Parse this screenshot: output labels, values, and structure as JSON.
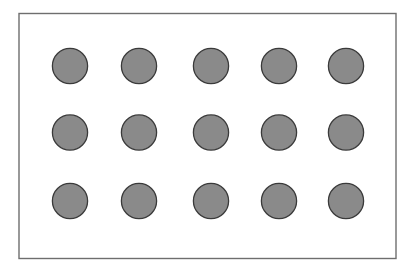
{
  "figure": {
    "canvas": {
      "width": 415,
      "height": 275,
      "background_color": "#FFFFFF"
    },
    "frame": {
      "name": "outer-rectangle",
      "x": 19,
      "y": 13.5,
      "width": 377,
      "height": 245,
      "fill_color": "#FFFFFF",
      "stroke_color": "#6E6E6E",
      "stroke_width": 1.4
    },
    "grid": {
      "rows": 3,
      "columns": 5,
      "count": 15,
      "shape": "circle",
      "radius": 17.6,
      "diameter": 35.2,
      "fill_color": "#8A8A8A",
      "stroke_color": "#3A3A3A",
      "stroke_width": 1.3,
      "column_centers_x": [
        70,
        139,
        211,
        279,
        346
      ],
      "row_centers_y": [
        66,
        132.5,
        201
      ],
      "column_spacing": 69,
      "row_spacing": 67.5
    },
    "circles": [
      {
        "id": "circle-r1c1",
        "row": 1,
        "col": 1,
        "cx": 70,
        "cy": 66
      },
      {
        "id": "circle-r1c2",
        "row": 1,
        "col": 2,
        "cx": 139,
        "cy": 66
      },
      {
        "id": "circle-r1c3",
        "row": 1,
        "col": 3,
        "cx": 211,
        "cy": 66
      },
      {
        "id": "circle-r1c4",
        "row": 1,
        "col": 4,
        "cx": 279,
        "cy": 66
      },
      {
        "id": "circle-r1c5",
        "row": 1,
        "col": 5,
        "cx": 346,
        "cy": 66
      },
      {
        "id": "circle-r2c1",
        "row": 2,
        "col": 1,
        "cx": 70,
        "cy": 132.5
      },
      {
        "id": "circle-r2c2",
        "row": 2,
        "col": 2,
        "cx": 139,
        "cy": 132.5
      },
      {
        "id": "circle-r2c3",
        "row": 2,
        "col": 3,
        "cx": 211,
        "cy": 132.5
      },
      {
        "id": "circle-r2c4",
        "row": 2,
        "col": 4,
        "cx": 279,
        "cy": 132.5
      },
      {
        "id": "circle-r2c5",
        "row": 2,
        "col": 5,
        "cx": 346,
        "cy": 132.5
      },
      {
        "id": "circle-r3c1",
        "row": 3,
        "col": 1,
        "cx": 70,
        "cy": 201
      },
      {
        "id": "circle-r3c2",
        "row": 3,
        "col": 2,
        "cx": 139,
        "cy": 201
      },
      {
        "id": "circle-r3c3",
        "row": 3,
        "col": 3,
        "cx": 211,
        "cy": 201
      },
      {
        "id": "circle-r3c4",
        "row": 3,
        "col": 4,
        "cx": 279,
        "cy": 201
      },
      {
        "id": "circle-r3c5",
        "row": 3,
        "col": 5,
        "cx": 346,
        "cy": 201
      }
    ]
  }
}
